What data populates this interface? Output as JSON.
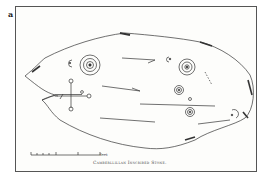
{
  "figure": {
    "label": "a",
    "caption": "Camberllillan Inscribed Stone.",
    "scale_bar": {
      "tick_labels": [
        "",
        "",
        "",
        "1",
        "1",
        "3"
      ],
      "unit": "feet"
    },
    "carvings": [
      "cup-and-ring",
      "cup-and-ring",
      "cup-and-ring",
      "cup-and-ring",
      "cup-and-ring",
      "cup",
      "cross-shaped incised figure",
      "incised lines"
    ]
  },
  "colors": {
    "ink": "#333333",
    "paper": "#fdfdfb",
    "frame": "#555555"
  }
}
